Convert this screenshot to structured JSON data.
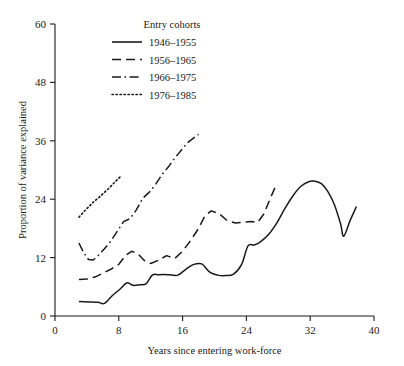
{
  "chart_data": {
    "type": "line",
    "title": "",
    "xlabel": "Years since entering work-force",
    "ylabel": "Proportion of variance explained",
    "xlim": [
      0,
      40
    ],
    "ylim": [
      0,
      60
    ],
    "xticks": [
      "0",
      "8",
      "16",
      "24",
      "32",
      "40"
    ],
    "yticks": [
      "0",
      "12",
      "24",
      "36",
      "48",
      "60"
    ],
    "grid": false,
    "legend_position": "top-center",
    "legend_title": "Entry cohorts",
    "series": [
      {
        "name": "1946–1955",
        "style": "solid",
        "x": [
          3.0,
          4.2,
          5.4,
          6.2,
          7.2,
          8.2,
          9.0,
          9.8,
          10.6,
          11.4,
          12.2,
          13.0,
          14.2,
          15.4,
          16.4,
          17.4,
          18.4,
          19.4,
          20.4,
          21.4,
          22.4,
          23.4,
          24.2,
          25.0,
          25.8,
          26.8,
          27.8,
          28.8,
          29.8,
          30.8,
          31.8,
          32.6,
          33.4,
          34.2,
          35.0,
          35.8,
          36.2,
          37.0,
          37.8
        ],
        "y": [
          3.0,
          2.9,
          2.8,
          2.6,
          4.2,
          5.6,
          6.8,
          6.3,
          6.4,
          6.6,
          8.4,
          8.5,
          8.5,
          8.4,
          9.6,
          10.6,
          10.7,
          9.0,
          8.4,
          8.3,
          8.6,
          10.6,
          14.4,
          14.6,
          15.3,
          16.8,
          19.1,
          22.0,
          24.6,
          26.6,
          27.6,
          27.7,
          27.2,
          25.6,
          23.0,
          19.0,
          16.4,
          19.6,
          22.5
        ]
      },
      {
        "name": "1956–1965",
        "style": "dashed",
        "x": [
          3.0,
          4.0,
          5.0,
          6.0,
          7.0,
          8.0,
          8.8,
          9.6,
          10.4,
          11.2,
          12.0,
          13.0,
          14.0,
          15.0,
          16.0,
          17.0,
          18.0,
          18.8,
          19.6,
          20.6,
          21.6,
          22.6,
          23.6,
          24.6,
          25.4,
          26.2,
          27.0,
          27.8
        ],
        "y": [
          7.5,
          7.6,
          8.0,
          8.8,
          9.6,
          10.6,
          12.4,
          13.3,
          12.8,
          11.4,
          10.8,
          11.5,
          12.4,
          11.8,
          13.3,
          15.5,
          18.0,
          20.6,
          21.6,
          21.0,
          19.6,
          19.1,
          19.3,
          19.4,
          19.2,
          21.0,
          24.2,
          27.2
        ]
      },
      {
        "name": "1966–1975",
        "style": "dashdot",
        "x": [
          3.0,
          3.6,
          4.2,
          4.8,
          5.4,
          6.2,
          7.0,
          7.8,
          8.6,
          9.4,
          10.2,
          11.0,
          11.8,
          12.6,
          13.4,
          14.2,
          15.0,
          15.8,
          16.6,
          17.4,
          18.0
        ],
        "y": [
          15.0,
          13.0,
          11.6,
          11.5,
          12.4,
          13.8,
          15.4,
          17.4,
          19.4,
          20.0,
          21.8,
          24.2,
          25.4,
          27.0,
          29.0,
          30.6,
          32.4,
          34.0,
          35.6,
          36.6,
          37.3
        ]
      },
      {
        "name": "1976–1985",
        "style": "dotted",
        "x": [
          3.0,
          3.6,
          4.2,
          4.8,
          5.4,
          6.0,
          6.6,
          7.2,
          7.8,
          8.3
        ],
        "y": [
          20.3,
          21.4,
          22.4,
          23.4,
          24.2,
          25.1,
          26.0,
          27.0,
          28.0,
          28.8
        ]
      }
    ]
  },
  "colors": {
    "axis": "#1a1a1a",
    "line": "#1a1a1a",
    "background": "#ffffff"
  }
}
